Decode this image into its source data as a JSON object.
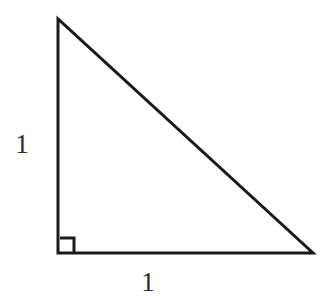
{
  "figure": {
    "kind": "right-triangle-diagram",
    "background_color": "#ffffff",
    "stroke_color": "#1a1a1a",
    "stroke_width": 3,
    "canvas": {
      "width": 331,
      "height": 304
    },
    "vertices": {
      "apex": {
        "x": 58,
        "y": 19
      },
      "right_angle": {
        "x": 58,
        "y": 253
      },
      "base_right": {
        "x": 313,
        "y": 253
      }
    },
    "right_angle_marker": {
      "name": "right-angle-square",
      "x": 60,
      "y": 238,
      "size": 14,
      "stroke_width": 3
    },
    "labels": {
      "vertical_leg": "1",
      "horizontal_leg": "1"
    }
  }
}
